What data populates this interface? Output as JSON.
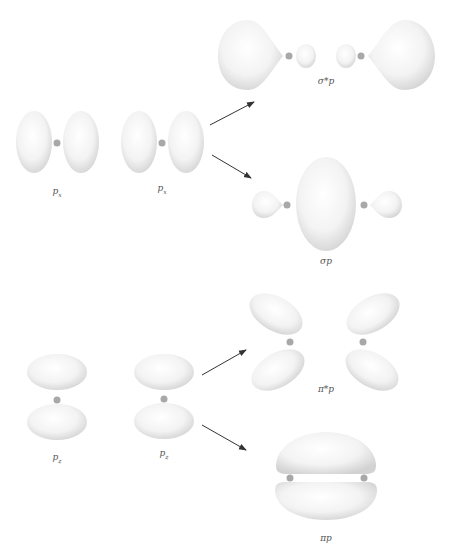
{
  "colors": {
    "lobe_fill": "#f4f4f4",
    "lobe_edge": "#d6d6d6",
    "nucleus": "#a8a8a8",
    "arrow": "#333333",
    "label": "#555555"
  },
  "labels": {
    "px_left": "p",
    "px_left_sub": "x",
    "px_right": "p",
    "px_right_sub": "x",
    "sigma_star": "σ*p",
    "sigma": "σp",
    "pz_left": "p",
    "pz_left_sub": "z",
    "pz_right": "p",
    "pz_right_sub": "z",
    "pi_star": "π*p",
    "pi": "πp"
  },
  "groups": [
    {
      "name": "px-atomic-orbitals",
      "items": [
        "p_x",
        "p_x"
      ]
    },
    {
      "name": "sigma-molecular-orbitals",
      "items": [
        "σ*p",
        "σp"
      ]
    },
    {
      "name": "pz-atomic-orbitals",
      "items": [
        "p_z",
        "p_z"
      ]
    },
    {
      "name": "pi-molecular-orbitals",
      "items": [
        "π*p",
        "πp"
      ]
    }
  ]
}
